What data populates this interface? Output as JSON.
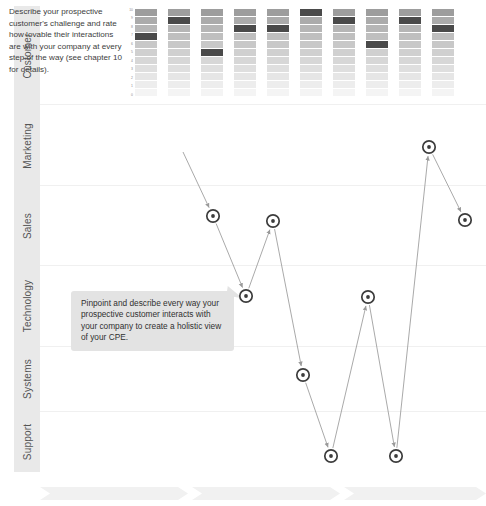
{
  "page": {
    "background": "#ffffff",
    "width": 486,
    "height": 506
  },
  "rail": {
    "name": "category-rail",
    "fill": "#e9e9e9",
    "text_color": "#555555",
    "items": [
      {
        "label": "Customer",
        "top": 0,
        "height": 100
      },
      {
        "label": "Marketing",
        "top": 100,
        "height": 80
      },
      {
        "label": "Sales",
        "top": 180,
        "height": 80
      },
      {
        "label": "Technology",
        "top": 260,
        "height": 80
      },
      {
        "label": "Systems",
        "top": 340,
        "height": 66
      },
      {
        "label": "Support",
        "top": 406,
        "height": 60
      }
    ]
  },
  "intro": {
    "name": "intro-paragraph",
    "text": "Describe your prospective customer's challenge and rate how lovable their interactions are with your company at every step of the way (see chapter 10 for details)."
  },
  "callout": {
    "name": "callout-box",
    "text": "Pinpoint and describe every way your prospective customer interacts with your company  to create a holistic view of your CPE.",
    "fill": "#e3e3e3",
    "left": 71,
    "top": 291,
    "width": 163,
    "height": 50
  },
  "chart_data": {
    "type": "heatmap",
    "ylabel": "",
    "xlabel": "",
    "ylim": [
      0,
      10
    ],
    "grid": false,
    "legend": "none",
    "tick_labels": [
      "10",
      "9",
      "8",
      "7",
      "6",
      "5",
      "4",
      "3",
      "2",
      "1",
      "0"
    ],
    "categories": [
      "1",
      "2",
      "3",
      "4",
      "5",
      "6",
      "7",
      "8",
      "9",
      "10"
    ],
    "highlight_color": "#4a4a4a",
    "gradient_top": "#9d9d9d",
    "gradient_bottom": "#f2f2f2",
    "values": [
      7,
      9,
      5,
      8,
      8,
      10,
      9,
      6,
      9,
      8
    ],
    "columns": [
      {
        "index": 1,
        "x": 0,
        "highlight_level": 7
      },
      {
        "index": 2,
        "x": 33,
        "highlight_level": 9
      },
      {
        "index": 3,
        "x": 66,
        "highlight_level": 5
      },
      {
        "index": 4,
        "x": 99,
        "highlight_level": 8
      },
      {
        "index": 5,
        "x": 132,
        "highlight_level": 8
      },
      {
        "index": 6,
        "x": 165,
        "highlight_level": 10
      },
      {
        "index": 7,
        "x": 198,
        "highlight_level": 9
      },
      {
        "index": 8,
        "x": 231,
        "highlight_level": 6
      },
      {
        "index": 9,
        "x": 264,
        "highlight_level": 9
      },
      {
        "index": 10,
        "x": 297,
        "highlight_level": 8
      }
    ]
  },
  "journey": {
    "name": "touchpoint-path",
    "marker_color": "#3c3c3c",
    "line_color": "#9a9a9a",
    "points": [
      {
        "id": "p1",
        "x": 213,
        "y": 216,
        "band": "Sales"
      },
      {
        "id": "p2",
        "x": 246,
        "y": 296,
        "band": "Technology"
      },
      {
        "id": "p3",
        "x": 273,
        "y": 221,
        "band": "Sales"
      },
      {
        "id": "p4",
        "x": 303,
        "y": 375,
        "band": "Systems"
      },
      {
        "id": "p5",
        "x": 331,
        "y": 456,
        "band": "Support"
      },
      {
        "id": "p6",
        "x": 368,
        "y": 297,
        "band": "Technology"
      },
      {
        "id": "p7",
        "x": 396,
        "y": 456,
        "band": "Support"
      },
      {
        "id": "p8",
        "x": 429,
        "y": 147,
        "band": "Marketing"
      },
      {
        "id": "p9",
        "x": 465,
        "y": 220,
        "band": "Sales"
      }
    ],
    "entry_from": {
      "x": 183,
      "y": 152
    }
  },
  "band_lines": [
    {
      "y": 98
    },
    {
      "y": 179
    },
    {
      "y": 259
    },
    {
      "y": 340
    },
    {
      "y": 405
    }
  ],
  "chevrons": {
    "name": "stage-chevron-strip",
    "fill": "#f1f1f1",
    "items": [
      {
        "left": 0,
        "width": 148
      },
      {
        "left": 152,
        "width": 148
      },
      {
        "left": 304,
        "width": 142
      }
    ]
  }
}
